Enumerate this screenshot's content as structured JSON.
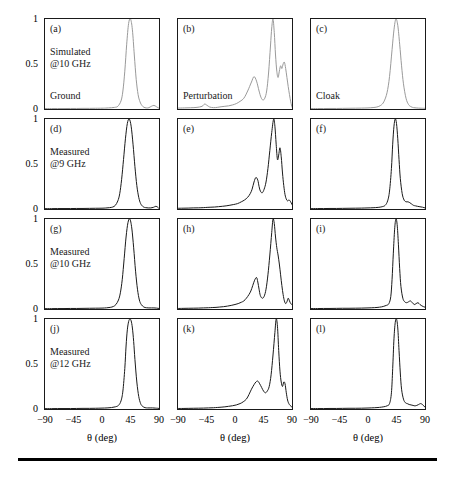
{
  "figure": {
    "title": "",
    "axis_title": "θ (deg)",
    "y_ticks": [
      "0",
      "0.5",
      "1"
    ],
    "y_tick_values": [
      0,
      0.5,
      1
    ],
    "x_ticks": [
      "−90",
      "−45",
      "0",
      "45",
      "90"
    ],
    "x_tick_values": [
      -90,
      -45,
      0,
      45,
      90
    ],
    "colors": {
      "simulated_curve": "#9a9a9a",
      "measured_curve": "#1a1a1a",
      "axis": "#1a1a1a",
      "rule": "#000000"
    },
    "row_captions": [
      [
        "Simulated",
        "@10 GHz"
      ],
      [
        "Measured",
        "@9 GHz"
      ],
      [
        "Measured",
        "@10 GHz"
      ],
      [
        "Measured",
        "@12 GHz"
      ]
    ],
    "column_captions": [
      "Ground",
      "Perturbation",
      "Cloak"
    ]
  },
  "chart_data": {
    "type": "line",
    "title": "",
    "xlabel": "θ (deg)",
    "ylabel": "",
    "xlim": [
      -90,
      90
    ],
    "ylim": [
      0,
      1
    ],
    "grid": false,
    "legend": "none",
    "panels": [
      {
        "id": "a",
        "label": "(a)",
        "row": 0,
        "col": 0,
        "row_caption": [
          "Simulated",
          "@10 GHz"
        ],
        "col_caption": "Ground",
        "color": "#9a9a9a",
        "x": [
          -90,
          -80,
          -70,
          -60,
          -50,
          -40,
          -30,
          -20,
          -10,
          0,
          5,
          10,
          15,
          20,
          25,
          30,
          33,
          36,
          39,
          42,
          45,
          48,
          51,
          54,
          57,
          60,
          63,
          66,
          70,
          74,
          78,
          82,
          86,
          90
        ],
        "y": [
          0.005,
          0.005,
          0.005,
          0.005,
          0.006,
          0.006,
          0.007,
          0.007,
          0.008,
          0.009,
          0.01,
          0.012,
          0.014,
          0.018,
          0.03,
          0.09,
          0.2,
          0.42,
          0.72,
          0.95,
          1.0,
          0.88,
          0.6,
          0.33,
          0.16,
          0.08,
          0.04,
          0.02,
          0.012,
          0.015,
          0.03,
          0.04,
          0.025,
          0.008
        ]
      },
      {
        "id": "b",
        "label": "(b)",
        "row": 0,
        "col": 1,
        "row_caption": [
          "Simulated",
          "@10 GHz"
        ],
        "col_caption": "Perturbation",
        "color": "#9a9a9a",
        "x": [
          -90,
          -80,
          -70,
          -60,
          -52,
          -48,
          -44,
          -40,
          -34,
          -28,
          -22,
          -16,
          -10,
          -4,
          2,
          8,
          14,
          20,
          26,
          30,
          34,
          38,
          41,
          44,
          47,
          50,
          53,
          56,
          58,
          60,
          62,
          64,
          66,
          68,
          70,
          72,
          74,
          76,
          78,
          80,
          82,
          84,
          86,
          88,
          90
        ],
        "y": [
          0.01,
          0.012,
          0.014,
          0.018,
          0.03,
          0.055,
          0.04,
          0.022,
          0.015,
          0.018,
          0.025,
          0.03,
          0.035,
          0.045,
          0.06,
          0.085,
          0.12,
          0.2,
          0.3,
          0.36,
          0.31,
          0.2,
          0.13,
          0.1,
          0.12,
          0.2,
          0.4,
          0.7,
          0.9,
          1.0,
          0.85,
          0.6,
          0.42,
          0.35,
          0.42,
          0.48,
          0.45,
          0.5,
          0.52,
          0.45,
          0.35,
          0.25,
          0.16,
          0.08,
          0.02
        ]
      },
      {
        "id": "c",
        "label": "(c)",
        "row": 0,
        "col": 2,
        "row_caption": [
          "Simulated",
          "@10 GHz"
        ],
        "col_caption": "Cloak",
        "color": "#9a9a9a",
        "x": [
          -90,
          -80,
          -70,
          -60,
          -50,
          -40,
          -30,
          -20,
          -10,
          0,
          8,
          14,
          20,
          25,
          30,
          34,
          38,
          41,
          44,
          47,
          50,
          53,
          56,
          60,
          64,
          68,
          72,
          76,
          80,
          84,
          88,
          90
        ],
        "y": [
          0.005,
          0.005,
          0.005,
          0.006,
          0.006,
          0.007,
          0.008,
          0.009,
          0.01,
          0.012,
          0.016,
          0.022,
          0.04,
          0.08,
          0.18,
          0.36,
          0.66,
          0.88,
          1.0,
          0.93,
          0.72,
          0.48,
          0.28,
          0.12,
          0.05,
          0.025,
          0.015,
          0.012,
          0.01,
          0.009,
          0.008,
          0.008
        ]
      },
      {
        "id": "d",
        "label": "(d)",
        "row": 1,
        "col": 0,
        "row_caption": [
          "Measured",
          "@9 GHz"
        ],
        "col_caption": "Ground",
        "color": "#1a1a1a",
        "x": [
          -90,
          -80,
          -70,
          -60,
          -50,
          -40,
          -30,
          -20,
          -10,
          0,
          6,
          12,
          17,
          21,
          25,
          28,
          31,
          34,
          37,
          40,
          43,
          46,
          49,
          52,
          55,
          58,
          61,
          65,
          69,
          73,
          77,
          81,
          85,
          88,
          90
        ],
        "y": [
          0.004,
          0.004,
          0.005,
          0.005,
          0.005,
          0.006,
          0.006,
          0.007,
          0.008,
          0.009,
          0.011,
          0.015,
          0.022,
          0.04,
          0.09,
          0.17,
          0.33,
          0.55,
          0.78,
          0.95,
          1.0,
          0.92,
          0.72,
          0.47,
          0.26,
          0.13,
          0.06,
          0.025,
          0.015,
          0.012,
          0.012,
          0.018,
          0.03,
          0.02,
          0.006
        ]
      },
      {
        "id": "e",
        "label": "(e)",
        "row": 1,
        "col": 1,
        "row_caption": [
          "Measured",
          "@9 GHz"
        ],
        "col_caption": "Perturbation",
        "color": "#1a1a1a",
        "x": [
          -90,
          -82,
          -74,
          -66,
          -58,
          -50,
          -44,
          -38,
          -32,
          -26,
          -20,
          -14,
          -8,
          -2,
          4,
          10,
          15,
          20,
          24,
          27,
          30,
          33,
          36,
          38,
          40,
          43,
          46,
          49,
          52,
          55,
          58,
          61,
          63,
          65,
          67,
          69,
          71,
          73,
          75,
          77,
          79,
          81,
          83,
          85,
          87,
          90
        ],
        "y": [
          0.008,
          0.009,
          0.01,
          0.012,
          0.013,
          0.015,
          0.018,
          0.02,
          0.022,
          0.026,
          0.03,
          0.035,
          0.042,
          0.05,
          0.06,
          0.08,
          0.1,
          0.13,
          0.17,
          0.22,
          0.3,
          0.35,
          0.32,
          0.25,
          0.2,
          0.18,
          0.22,
          0.3,
          0.45,
          0.65,
          0.85,
          1.0,
          0.92,
          0.72,
          0.55,
          0.6,
          0.68,
          0.58,
          0.4,
          0.26,
          0.16,
          0.11,
          0.09,
          0.1,
          0.09,
          0.05
        ]
      },
      {
        "id": "f",
        "label": "(f)",
        "row": 1,
        "col": 2,
        "row_caption": [
          "Measured",
          "@9 GHz"
        ],
        "col_caption": "Cloak",
        "color": "#1a1a1a",
        "x": [
          -90,
          -80,
          -70,
          -60,
          -50,
          -40,
          -30,
          -20,
          -10,
          0,
          8,
          16,
          22,
          27,
          31,
          34,
          37,
          39,
          41,
          43,
          45,
          47,
          49,
          51,
          54,
          57,
          60,
          63,
          66,
          69,
          72,
          75,
          78,
          82,
          86,
          90
        ],
        "y": [
          0.004,
          0.005,
          0.005,
          0.006,
          0.006,
          0.007,
          0.008,
          0.009,
          0.01,
          0.012,
          0.014,
          0.018,
          0.025,
          0.04,
          0.09,
          0.2,
          0.45,
          0.72,
          0.92,
          1.0,
          0.95,
          0.78,
          0.55,
          0.34,
          0.17,
          0.1,
          0.08,
          0.08,
          0.07,
          0.055,
          0.04,
          0.035,
          0.03,
          0.025,
          0.02,
          0.012
        ]
      },
      {
        "id": "g",
        "label": "(g)",
        "row": 2,
        "col": 0,
        "row_caption": [
          "Measured",
          "@10 GHz"
        ],
        "col_caption": "Ground",
        "color": "#1a1a1a",
        "x": [
          -90,
          -80,
          -70,
          -60,
          -50,
          -40,
          -30,
          -20,
          -10,
          0,
          7,
          13,
          18,
          22,
          26,
          29,
          32,
          35,
          38,
          41,
          44,
          47,
          50,
          53,
          56,
          59,
          62,
          66,
          70,
          74,
          78,
          82,
          86,
          90
        ],
        "y": [
          0.004,
          0.004,
          0.005,
          0.005,
          0.006,
          0.006,
          0.007,
          0.008,
          0.009,
          0.01,
          0.013,
          0.018,
          0.028,
          0.05,
          0.1,
          0.18,
          0.33,
          0.56,
          0.8,
          0.96,
          1.0,
          0.9,
          0.68,
          0.42,
          0.22,
          0.1,
          0.05,
          0.022,
          0.014,
          0.012,
          0.012,
          0.012,
          0.01,
          0.006
        ]
      },
      {
        "id": "h",
        "label": "(h)",
        "row": 2,
        "col": 1,
        "row_caption": [
          "Measured",
          "@10 GHz"
        ],
        "col_caption": "Perturbation",
        "color": "#1a1a1a",
        "x": [
          -90,
          -82,
          -74,
          -66,
          -58,
          -50,
          -42,
          -36,
          -30,
          -24,
          -18,
          -12,
          -6,
          0,
          5,
          10,
          14,
          18,
          22,
          25,
          28,
          31,
          34,
          36,
          38,
          40,
          43,
          46,
          49,
          52,
          55,
          58,
          60,
          62,
          64,
          66,
          68,
          70,
          72,
          74,
          76,
          78,
          80,
          82,
          84,
          86,
          88,
          90
        ],
        "y": [
          0.006,
          0.007,
          0.008,
          0.009,
          0.01,
          0.012,
          0.014,
          0.016,
          0.018,
          0.022,
          0.026,
          0.032,
          0.04,
          0.05,
          0.06,
          0.075,
          0.09,
          0.12,
          0.16,
          0.2,
          0.26,
          0.32,
          0.35,
          0.3,
          0.22,
          0.15,
          0.12,
          0.14,
          0.22,
          0.38,
          0.6,
          0.85,
          1.0,
          0.95,
          0.8,
          0.68,
          0.6,
          0.5,
          0.38,
          0.26,
          0.16,
          0.09,
          0.06,
          0.08,
          0.12,
          0.09,
          0.06,
          0.05
        ]
      },
      {
        "id": "i",
        "label": "(i)",
        "row": 2,
        "col": 2,
        "row_caption": [
          "Measured",
          "@10 GHz"
        ],
        "col_caption": "Cloak",
        "color": "#1a1a1a",
        "x": [
          -90,
          -80,
          -70,
          -60,
          -50,
          -40,
          -30,
          -20,
          -10,
          0,
          10,
          18,
          24,
          29,
          33,
          36,
          38,
          40,
          42,
          44,
          46,
          48,
          50,
          52,
          55,
          58,
          61,
          64,
          67,
          70,
          73,
          76,
          79,
          82,
          85,
          88,
          90
        ],
        "y": [
          0.005,
          0.005,
          0.006,
          0.006,
          0.007,
          0.008,
          0.008,
          0.009,
          0.01,
          0.012,
          0.015,
          0.02,
          0.028,
          0.04,
          0.06,
          0.14,
          0.33,
          0.62,
          0.88,
          1.0,
          0.94,
          0.72,
          0.45,
          0.25,
          0.12,
          0.08,
          0.07,
          0.08,
          0.09,
          0.07,
          0.05,
          0.06,
          0.07,
          0.05,
          0.035,
          0.025,
          0.02
        ]
      },
      {
        "id": "j",
        "label": "(j)",
        "row": 3,
        "col": 0,
        "row_caption": [
          "Measured",
          "@12 GHz"
        ],
        "col_caption": "Ground",
        "color": "#1a1a1a",
        "x": [
          -90,
          -80,
          -70,
          -60,
          -50,
          -40,
          -30,
          -20,
          -10,
          0,
          8,
          15,
          21,
          26,
          30,
          33,
          36,
          38,
          40,
          42,
          44,
          46,
          48,
          50,
          52,
          55,
          58,
          61,
          64,
          68,
          72,
          76,
          80,
          84,
          88,
          90
        ],
        "y": [
          0.004,
          0.004,
          0.005,
          0.005,
          0.005,
          0.006,
          0.007,
          0.007,
          0.008,
          0.01,
          0.012,
          0.016,
          0.024,
          0.04,
          0.09,
          0.2,
          0.45,
          0.7,
          0.88,
          0.97,
          1.0,
          0.98,
          0.9,
          0.75,
          0.55,
          0.3,
          0.14,
          0.06,
          0.03,
          0.015,
          0.012,
          0.012,
          0.012,
          0.01,
          0.008,
          0.006
        ]
      },
      {
        "id": "k",
        "label": "(k)",
        "row": 3,
        "col": 1,
        "row_caption": [
          "Measured",
          "@12 GHz"
        ],
        "col_caption": "Perturbation",
        "color": "#1a1a1a",
        "x": [
          -90,
          -82,
          -74,
          -66,
          -58,
          -50,
          -42,
          -34,
          -28,
          -22,
          -16,
          -10,
          -4,
          2,
          8,
          13,
          18,
          22,
          26,
          30,
          33,
          36,
          39,
          42,
          45,
          48,
          51,
          54,
          57,
          60,
          63,
          65,
          67,
          69,
          71,
          73,
          75,
          77,
          79,
          81,
          83,
          85,
          87,
          90
        ],
        "y": [
          0.006,
          0.006,
          0.007,
          0.008,
          0.009,
          0.01,
          0.012,
          0.014,
          0.017,
          0.02,
          0.024,
          0.03,
          0.036,
          0.045,
          0.06,
          0.08,
          0.11,
          0.16,
          0.22,
          0.27,
          0.3,
          0.31,
          0.28,
          0.24,
          0.2,
          0.18,
          0.2,
          0.25,
          0.38,
          0.6,
          0.85,
          1.0,
          0.92,
          0.65,
          0.42,
          0.3,
          0.25,
          0.3,
          0.28,
          0.18,
          0.1,
          0.06,
          0.04,
          0.02
        ]
      },
      {
        "id": "l",
        "label": "(l)",
        "row": 3,
        "col": 2,
        "row_caption": [
          "Measured",
          "@12 GHz"
        ],
        "col_caption": "Cloak",
        "color": "#1a1a1a",
        "x": [
          -90,
          -80,
          -70,
          -60,
          -50,
          -40,
          -30,
          -20,
          -10,
          0,
          10,
          18,
          25,
          30,
          34,
          37,
          39,
          41,
          43,
          45,
          47,
          49,
          51,
          53,
          56,
          59,
          62,
          65,
          68,
          71,
          74,
          77,
          80,
          83,
          86,
          88,
          90
        ],
        "y": [
          0.005,
          0.005,
          0.005,
          0.006,
          0.006,
          0.007,
          0.008,
          0.008,
          0.009,
          0.011,
          0.014,
          0.018,
          0.025,
          0.035,
          0.06,
          0.18,
          0.45,
          0.78,
          0.96,
          1.0,
          0.9,
          0.65,
          0.4,
          0.22,
          0.11,
          0.07,
          0.06,
          0.05,
          0.045,
          0.04,
          0.035,
          0.04,
          0.05,
          0.06,
          0.05,
          0.035,
          0.02
        ]
      }
    ]
  }
}
